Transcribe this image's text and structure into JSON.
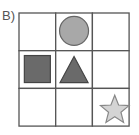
{
  "option_label": "B)",
  "grid": {
    "rows": 3,
    "cols": 3,
    "line_color": "#555555",
    "cells": [
      {
        "row": 0,
        "col": 1,
        "shape": "circle",
        "fill": "#a8a8a8",
        "stroke": "#666666"
      },
      {
        "row": 1,
        "col": 0,
        "shape": "square",
        "fill": "#6a6a6a",
        "stroke": "#444444"
      },
      {
        "row": 1,
        "col": 1,
        "shape": "triangle",
        "fill": "#6a6a6a",
        "stroke": "#444444"
      },
      {
        "row": 2,
        "col": 2,
        "shape": "star",
        "fill": "#d4d4d4",
        "stroke": "#888888"
      }
    ]
  }
}
